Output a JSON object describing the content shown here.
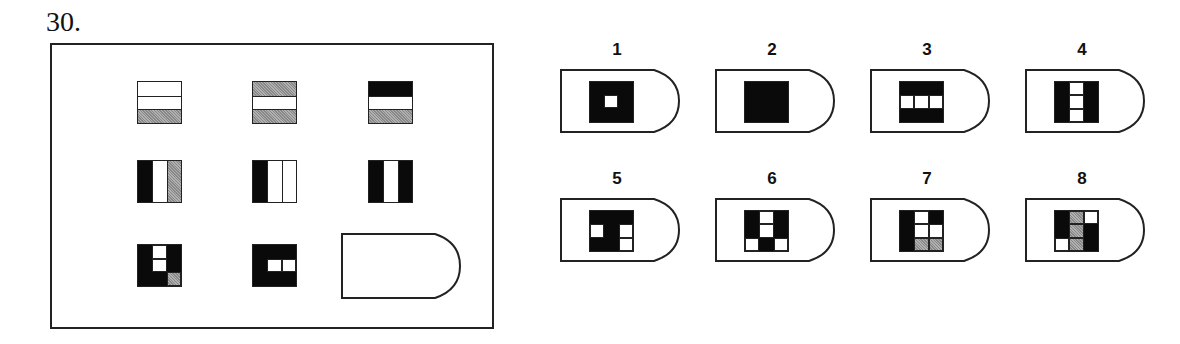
{
  "question_number": "30.",
  "matrix": {
    "rows": [
      [
        {
          "layout": "rows",
          "cells": [
            "W",
            "W",
            "G"
          ]
        },
        {
          "layout": "rows",
          "cells": [
            "G",
            "W",
            "G"
          ]
        },
        {
          "layout": "rows",
          "cells": [
            "B",
            "W",
            "G"
          ]
        }
      ],
      [
        {
          "layout": "cols",
          "cells": [
            "B",
            "W",
            "G"
          ]
        },
        {
          "layout": "cols",
          "cells": [
            "B",
            "W",
            "W"
          ]
        },
        {
          "layout": "cols",
          "cells": [
            "B",
            "W",
            "B"
          ]
        }
      ],
      [
        {
          "layout": "grid3",
          "cells": [
            "B",
            "W",
            "B",
            "B",
            "W",
            "B",
            "B",
            "B",
            "G"
          ]
        },
        {
          "layout": "grid3",
          "cells": [
            "B",
            "B",
            "B",
            "B",
            "W",
            "W",
            "B",
            "B",
            "B"
          ]
        },
        {
          "layout": "blank"
        }
      ]
    ]
  },
  "options": [
    {
      "label": "1",
      "layout": "ring",
      "cells": [
        "B",
        "W",
        "B"
      ]
    },
    {
      "label": "2",
      "layout": "solid",
      "cells": [
        "B"
      ]
    },
    {
      "label": "3",
      "layout": "grid3",
      "cells": [
        "B",
        "B",
        "B",
        "W",
        "W",
        "W",
        "B",
        "B",
        "B"
      ]
    },
    {
      "label": "4",
      "layout": "grid3",
      "cells": [
        "B",
        "W",
        "B",
        "B",
        "W",
        "B",
        "B",
        "W",
        "B"
      ]
    },
    {
      "label": "5",
      "layout": "grid3",
      "cells": [
        "B",
        "B",
        "B",
        "W",
        "B",
        "W",
        "B",
        "B",
        "W"
      ]
    },
    {
      "label": "6",
      "layout": "grid3",
      "cells": [
        "B",
        "W",
        "B",
        "B",
        "W",
        "B",
        "W",
        "B",
        "W"
      ]
    },
    {
      "label": "7",
      "layout": "grid3",
      "cells": [
        "B",
        "W",
        "B",
        "B",
        "W",
        "W",
        "B",
        "G",
        "G"
      ]
    },
    {
      "label": "8",
      "layout": "grid3",
      "cells": [
        "B",
        "G",
        "W",
        "B",
        "G",
        "B",
        "W",
        "G",
        "B"
      ]
    }
  ]
}
